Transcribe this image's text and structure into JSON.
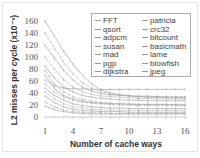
{
  "chart_data": {
    "type": "line",
    "title": "",
    "xlabel": "Number of cache ways",
    "ylabel": "L2 misses per cycle (x10⁻³)",
    "x": [
      1,
      2,
      3,
      4,
      5,
      6,
      7,
      8,
      9,
      10,
      11,
      12,
      13,
      14,
      15,
      16
    ],
    "xticks": [
      "1",
      "4",
      "7",
      "10",
      "13",
      "16"
    ],
    "yticks": [
      "0",
      "20",
      "40",
      "60",
      "80",
      "100",
      "140",
      "160"
    ],
    "yticks_full": [
      "0",
      "20",
      "40",
      "60",
      "80",
      "100",
      "120",
      "140",
      "160"
    ],
    "ylim": [
      0,
      160
    ],
    "xlim": [
      1,
      16
    ],
    "grid": false,
    "legend_position": "upper right (inside)",
    "series": [
      {
        "name": "FFT",
        "values": [
          160,
          135,
          110,
          88,
          70,
          55,
          45,
          40,
          37,
          35,
          34,
          33,
          33,
          32,
          32,
          32
        ]
      },
      {
        "name": "qsort",
        "values": [
          140,
          115,
          92,
          72,
          57,
          48,
          42,
          39,
          37,
          36,
          35,
          35,
          34,
          34,
          34,
          34
        ]
      },
      {
        "name": "adpcm",
        "values": [
          120,
          98,
          78,
          62,
          50,
          43,
          39,
          37,
          36,
          35,
          34,
          34,
          34,
          33,
          33,
          33
        ]
      },
      {
        "name": "susan",
        "values": [
          100,
          80,
          62,
          50,
          42,
          38,
          35,
          34,
          33,
          32,
          31,
          31,
          30,
          30,
          30,
          30
        ]
      },
      {
        "name": "mad",
        "values": [
          85,
          65,
          50,
          42,
          36,
          33,
          31,
          30,
          29,
          28,
          28,
          27,
          27,
          27,
          27,
          27
        ]
      },
      {
        "name": "pgp",
        "values": [
          78,
          55,
          42,
          34,
          29,
          26,
          24,
          23,
          22,
          22,
          21,
          21,
          21,
          21,
          21,
          21
        ]
      },
      {
        "name": "dijkstra",
        "values": [
          70,
          48,
          36,
          30,
          26,
          24,
          23,
          22,
          22,
          21,
          21,
          21,
          21,
          21,
          20,
          20
        ]
      },
      {
        "name": "patricia",
        "values": [
          62,
          52,
          48,
          47,
          47,
          46,
          46,
          46,
          46,
          46,
          46,
          46,
          46,
          46,
          46,
          46
        ]
      },
      {
        "name": "crc32",
        "values": [
          55,
          42,
          33,
          28,
          25,
          23,
          22,
          21,
          20,
          20,
          19,
          19,
          19,
          19,
          19,
          19
        ]
      },
      {
        "name": "bitcount",
        "values": [
          48,
          36,
          28,
          22,
          19,
          17,
          16,
          15,
          15,
          14,
          14,
          14,
          14,
          14,
          14,
          14
        ]
      },
      {
        "name": "basicmath",
        "values": [
          42,
          30,
          22,
          17,
          15,
          13,
          12,
          12,
          11,
          11,
          11,
          11,
          11,
          11,
          11,
          11
        ]
      },
      {
        "name": "lame",
        "values": [
          35,
          24,
          17,
          13,
          11,
          10,
          9,
          9,
          9,
          8,
          8,
          8,
          8,
          8,
          8,
          8
        ]
      },
      {
        "name": "blowfish",
        "values": [
          25,
          17,
          12,
          9,
          8,
          7,
          7,
          6,
          6,
          6,
          6,
          6,
          6,
          6,
          6,
          6
        ]
      },
      {
        "name": "jpeg",
        "values": [
          18,
          12,
          9,
          7,
          6,
          5,
          5,
          5,
          5,
          5,
          5,
          5,
          5,
          5,
          5,
          5
        ]
      }
    ]
  },
  "legend": {
    "col1": [
      "FFT",
      "qsort",
      "adpcm",
      "susan",
      "mad",
      "pgp",
      "dijkstra"
    ],
    "col2": [
      "patricia",
      "crc32",
      "bitcount",
      "basicmath",
      "lame",
      "blowfish",
      "jpeg"
    ]
  },
  "axes": {
    "x_title": "Number of cache ways",
    "y_title": "L2 misses per cycle (x10⁻³)",
    "x_ticks": [
      "1",
      "4",
      "7",
      "10",
      "13",
      "16"
    ],
    "y_ticks": [
      "0",
      "20",
      "40",
      "60",
      "80",
      "100",
      "120",
      "140",
      "160"
    ]
  },
  "colors": {
    "line": "#a8a8a8",
    "axis_text": "#555555",
    "legend_border": "#aaaaaa"
  }
}
